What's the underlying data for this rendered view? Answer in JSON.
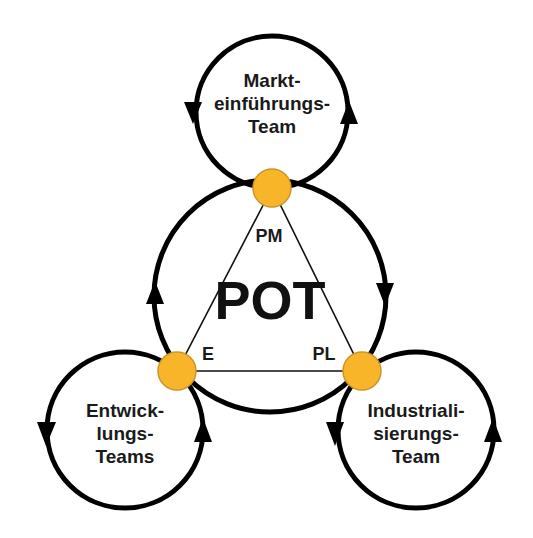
{
  "diagram": {
    "center": {
      "title": "POT"
    },
    "roles": {
      "top": "PM",
      "left": "E",
      "right": "PL"
    },
    "teams": {
      "top": [
        "Markt-",
        "einführungs-",
        "Team"
      ],
      "left": [
        "Entwick-",
        "lungs-",
        "Teams"
      ],
      "right": [
        "Industriali-",
        "sierungs-",
        "Team"
      ]
    },
    "colors": {
      "node": "#f9b52a",
      "node_border": "#c9962c",
      "stroke": "#000000"
    }
  }
}
